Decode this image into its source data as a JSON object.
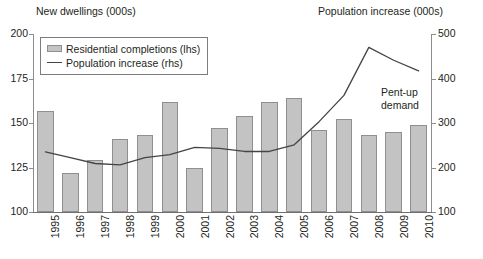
{
  "titles": {
    "left_axis_title": "New dwellings (000s)",
    "right_axis_title": "Population increase (000s)"
  },
  "legend": {
    "items": [
      {
        "label": "Residential completions (lhs)",
        "marker": "bar-swatch",
        "color": "#c3c3c3"
      },
      {
        "label": "Population increase (rhs)",
        "marker": "line-swatch",
        "color": "#444444"
      }
    ]
  },
  "annotation": {
    "line1": "Pent-up",
    "line2": "demand"
  },
  "chart_data": {
    "type": "bar",
    "title": "",
    "xlabel": "",
    "ylabel": "New dwellings (000s)",
    "y2label": "Population increase (000s)",
    "categories": [
      "1995",
      "1996",
      "1997",
      "1998",
      "1999",
      "2000",
      "2001",
      "2002",
      "2003",
      "2004",
      "2005",
      "2006",
      "2007",
      "2008",
      "2009",
      "2010"
    ],
    "ylim": [
      100,
      200
    ],
    "yticks": [
      100,
      125,
      150,
      175,
      200
    ],
    "y2lim": [
      100,
      500
    ],
    "y2ticks": [
      100,
      200,
      300,
      400,
      500
    ],
    "grid": false,
    "legend_position": "top-left",
    "series": [
      {
        "name": "Residential completions (lhs)",
        "type": "bar",
        "axis": "left",
        "color": "#c3c3c3",
        "values": [
          157,
          122,
          129,
          141,
          143,
          162,
          125,
          147,
          154,
          162,
          164,
          146,
          152,
          143,
          145,
          149
        ]
      },
      {
        "name": "Population increase (rhs)",
        "type": "line",
        "axis": "right",
        "color": "#444444",
        "values": [
          235,
          222,
          209,
          206,
          222,
          229,
          245,
          243,
          236,
          236,
          251,
          303,
          362,
          470,
          441,
          417
        ]
      }
    ]
  }
}
